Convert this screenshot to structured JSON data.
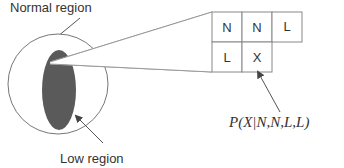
{
  "labels": {
    "normal_region": "Normal region",
    "low_region": "Low region",
    "formula": "P(X|N,N,L,L)"
  },
  "grid": {
    "row1": [
      "N",
      "N",
      "L"
    ],
    "row2": [
      "L",
      "X"
    ]
  },
  "colors": {
    "low_region_fill": "#5a5a5a",
    "outline": "#666666",
    "text": "#333333"
  }
}
